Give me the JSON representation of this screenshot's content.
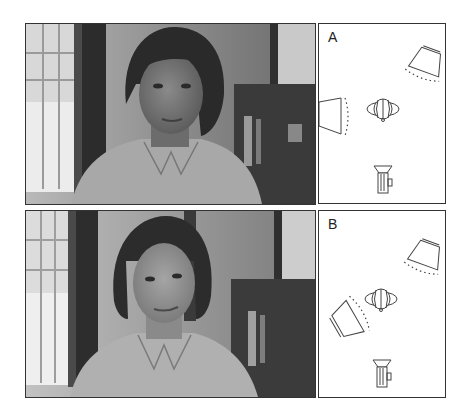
{
  "figure": {
    "panels": [
      {
        "label": "A",
        "photo_description": "Woman with short dark bob haircut, head tilted, shadowed face, light shirt, interior with window and bookshelf",
        "lighting_diagram": {
          "key_light": "upper-right, angled toward subject",
          "fill_light": "left side, facing right, close to subject",
          "subject": "head seen from above, center",
          "camera": "bottom center, facing up"
        }
      },
      {
        "label": "B",
        "photo_description": "Same woman, face more evenly lit, looking at camera, same interior",
        "lighting_diagram": {
          "key_light": "upper-right, angled toward subject",
          "fill_light": "lower-left, angled up-right toward subject",
          "subject": "head seen from above, center",
          "camera": "bottom center, facing up"
        }
      }
    ],
    "colors": {
      "background": "#ffffff",
      "border": "#333333",
      "line": "#444444"
    }
  }
}
